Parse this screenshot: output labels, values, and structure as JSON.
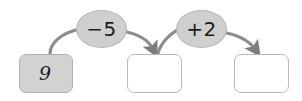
{
  "diagram": {
    "type": "number-chain-flow",
    "background_color": "#ffffff",
    "stroke_color": "#8c8c8c",
    "arrowhead_color": "#7d7d7d",
    "boxes": [
      {
        "name": "start-value-box",
        "value": "9",
        "filled": true,
        "fill_color": "#d2d2d2",
        "border_color": "#b0b0b0",
        "x": 19,
        "y": 54,
        "width": 54,
        "height": 39
      },
      {
        "name": "result-box-1",
        "value": "",
        "filled": false,
        "fill_color": "#ffffff",
        "border_color": "#b9b9b9",
        "x": 127,
        "y": 54,
        "width": 55,
        "height": 39
      },
      {
        "name": "result-box-2",
        "value": "",
        "filled": false,
        "fill_color": "#ffffff",
        "border_color": "#b9b9b9",
        "x": 234,
        "y": 54,
        "width": 55,
        "height": 39
      }
    ],
    "operations": [
      {
        "name": "operation-subtract-5",
        "label": "−5",
        "fill_color": "#cfcfcf",
        "border_color": "#b4b4b4",
        "x": 76,
        "y": 10,
        "width": 51,
        "height": 38
      },
      {
        "name": "operation-add-2",
        "label": "+2",
        "fill_color": "#cfcfcf",
        "border_color": "#b4b4b4",
        "x": 176,
        "y": 10,
        "width": 51,
        "height": 38
      }
    ],
    "arrows": [
      {
        "name": "arrow-box1-to-op1",
        "arrowhead": false,
        "path": "M 50 54 C 50 42 62 32 80 29"
      },
      {
        "name": "arrow-op1-to-box2",
        "arrowhead": true,
        "path": "M 123 31 C 140 35 150 42 154 51"
      },
      {
        "name": "arrow-box2-to-op2",
        "arrowhead": false,
        "path": "M 158 52 C 162 42 172 33 180 29"
      },
      {
        "name": "arrow-op2-to-box3",
        "arrowhead": true,
        "path": "M 223 32 C 240 36 250 43 256 51"
      }
    ]
  }
}
